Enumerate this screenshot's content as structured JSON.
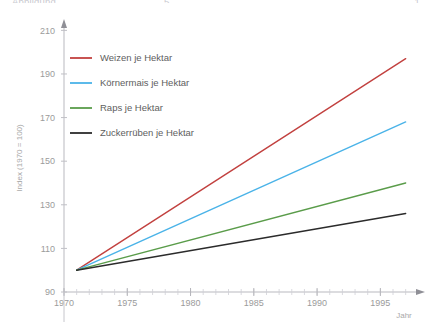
{
  "top_strip": {
    "left_fragment": "Abbildung",
    "mid_fragment": "5",
    "right_fragment": "1"
  },
  "chart_data": {
    "type": "line",
    "title": "",
    "xlabel": "Jahr",
    "ylabel": "Index (1970 = 100)",
    "xlim": [
      1970,
      1997.5
    ],
    "ylim": [
      90,
      212
    ],
    "xticks": [
      1970,
      1975,
      1980,
      1985,
      1990,
      1995
    ],
    "xtick_labels": [
      "1970",
      "1975",
      "1980",
      "1985",
      "1990",
      "1995"
    ],
    "yticks": [
      90,
      110,
      130,
      150,
      170,
      190,
      210
    ],
    "ytick_labels": [
      "90",
      "110",
      "130",
      "150",
      "170",
      "190",
      "210"
    ],
    "minor_xticks": true,
    "grid": false,
    "legend_position": "upper-left-inside",
    "x": [
      1971,
      1997
    ],
    "series": [
      {
        "name": "Weizen je Hektar",
        "color": "#c2413f",
        "values": [
          100,
          197
        ]
      },
      {
        "name": "Körnermais je Hektar",
        "color": "#4ab3e8",
        "values": [
          100,
          168
        ]
      },
      {
        "name": "Raps je Hektar",
        "color": "#5a9c4a",
        "values": [
          100,
          140
        ]
      },
      {
        "name": "Zuckerrüben je Hektar",
        "color": "#2b2b2b",
        "values": [
          100,
          126
        ]
      }
    ]
  },
  "axis": {
    "x_label": "Jahr",
    "y_label": "Index (1970 = 100)",
    "axis_color": "#b9b9bf"
  },
  "legend": {
    "items": [
      {
        "label": "Weizen je Hektar",
        "color": "#c2413f"
      },
      {
        "label": "Körnermais je Hektar",
        "color": "#4ab3e8"
      },
      {
        "label": "Raps je Hektar",
        "color": "#5a9c4a"
      },
      {
        "label": "Zuckerrüben je Hektar",
        "color": "#2b2b2b"
      }
    ]
  }
}
